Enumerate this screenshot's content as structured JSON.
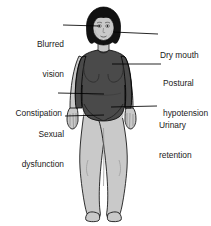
{
  "figure": {
    "colors": {
      "background": "#ffffff",
      "skin": "#c9c9c9",
      "skin_shadow": "#b3b3b3",
      "garment": "#4a4a4a",
      "garment_shadow": "#3a3a3a",
      "hair": "#121212",
      "outline": "#000000",
      "text": "#1a1a1a",
      "leader_line": "#000000"
    }
  },
  "labels": {
    "blurred_vision": {
      "line1": "Blurred",
      "line2": "vision",
      "side": "left"
    },
    "dry_mouth": {
      "line1": "Dry mouth",
      "line2": "",
      "side": "right"
    },
    "postural_hypotension": {
      "line1": "Postural",
      "line2": "hypotension",
      "side": "right"
    },
    "constipation": {
      "line1": "Constipation",
      "line2": "",
      "side": "left"
    },
    "sexual_dysfunction": {
      "line1": "Sexual",
      "line2": "dysfunction",
      "side": "left"
    },
    "urinary_retention": {
      "line1": "Urinary",
      "line2": "retention",
      "side": "right"
    }
  }
}
